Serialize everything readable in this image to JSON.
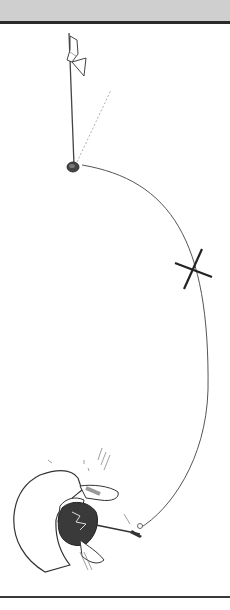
{
  "panel": {
    "type": "manga-panel",
    "scene": "overhead view of golfer swinging, ball flight arc toward hole with flag",
    "text": []
  },
  "colors": {
    "top_strip": "#cfcfcf",
    "border": "#2a2a2a",
    "ink": "#333333",
    "background": "#ffffff"
  }
}
